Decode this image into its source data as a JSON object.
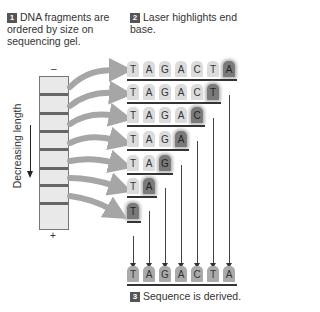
{
  "steps": [
    {
      "number": "1",
      "text": "DNA fragments are ordered by size on sequencing gel."
    },
    {
      "number": "2",
      "text": "Laser highlights end base."
    },
    {
      "number": "3",
      "text": "Sequence is derived."
    }
  ],
  "gel": {
    "minus_label": "–",
    "plus_label": "+",
    "axis_label": "Decreasing length",
    "band_count": 7
  },
  "fragments": [
    {
      "bases": [
        "T",
        "A",
        "G",
        "A",
        "C",
        "T",
        "A"
      ],
      "end_base": "A"
    },
    {
      "bases": [
        "T",
        "A",
        "G",
        "A",
        "C",
        "T"
      ],
      "end_base": "T"
    },
    {
      "bases": [
        "T",
        "A",
        "G",
        "A",
        "C"
      ],
      "end_base": "C"
    },
    {
      "bases": [
        "T",
        "A",
        "G",
        "A"
      ],
      "end_base": "A"
    },
    {
      "bases": [
        "T",
        "A",
        "G"
      ],
      "end_base": "G"
    },
    {
      "bases": [
        "T",
        "A"
      ],
      "end_base": "A"
    },
    {
      "bases": [
        "T"
      ],
      "end_base": "T"
    }
  ],
  "derived_sequence": [
    "T",
    "A",
    "G",
    "A",
    "C",
    "T",
    "A"
  ],
  "colors": {
    "badge": "#555555",
    "highlight": "#7a7a7a",
    "base": "#dcdcdc",
    "arrow": "#a6a6a6"
  }
}
